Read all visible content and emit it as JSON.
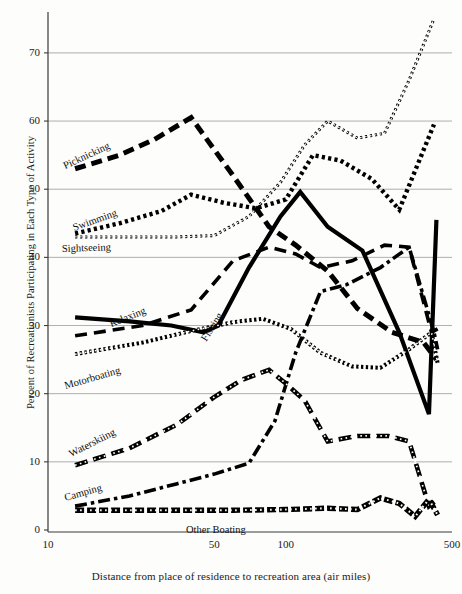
{
  "chart_data": {
    "type": "line",
    "title": "",
    "xlabel": "Distance from place of residence to recreation area (air miles)",
    "ylabel": "Percent of Recreationists Participating in Each Type of Activity",
    "xscale": "log",
    "xlim": [
      10,
      500
    ],
    "ylim": [
      0,
      76
    ],
    "xticks": [
      10,
      50,
      100,
      500
    ],
    "xticklabels": [
      "10",
      "50",
      "100",
      "500"
    ],
    "yticks": [
      0,
      10,
      20,
      30,
      40,
      50,
      60,
      70
    ],
    "yticklabels": [
      "0",
      "10",
      "20",
      "30",
      "40",
      "50",
      "60",
      "70"
    ],
    "grid": "horizontal",
    "legend": "inline-labels",
    "series": [
      {
        "name": "Sightseeing",
        "style": "cross-hatch-thin",
        "label_x": 62,
        "label_y": 243,
        "label_rot": -2,
        "x": [
          13,
          18,
          25,
          35,
          50,
          70,
          95,
          120,
          150,
          200,
          260,
          330,
          420
        ],
        "y": [
          43.0,
          43.0,
          43.0,
          43.0,
          43.2,
          46.0,
          51.0,
          56.5,
          60.0,
          57.5,
          58.2,
          66.0,
          75.0
        ]
      },
      {
        "name": "Swimming",
        "style": "dotted-square",
        "label_x": 75,
        "label_y": 222,
        "label_rot": -20,
        "x": [
          13,
          20,
          30,
          40,
          55,
          75,
          100,
          130,
          170,
          230,
          300,
          420
        ],
        "y": [
          43.5,
          45.0,
          46.8,
          49.2,
          48.0,
          47.2,
          48.5,
          55.0,
          54.2,
          51.5,
          47.0,
          59.5
        ]
      },
      {
        "name": "Picknicking",
        "style": "dashed-heavy",
        "label_x": 66,
        "label_y": 160,
        "label_rot": -25,
        "x": [
          13,
          20,
          28,
          40,
          60,
          85,
          110,
          150,
          200,
          280,
          380,
          430
        ],
        "y": [
          53.0,
          55.0,
          57.3,
          60.5,
          52.0,
          44.5,
          41.8,
          38.0,
          32.5,
          29.0,
          27.5,
          25.0
        ]
      },
      {
        "name": "Fishing",
        "style": "solid-heavy",
        "label_x": 208,
        "label_y": 332,
        "label_rot": -58,
        "x": [
          13,
          22,
          33,
          45,
          52,
          70,
          95,
          115,
          150,
          210,
          300,
          400,
          430
        ],
        "y": [
          31.2,
          30.6,
          30.0,
          29.0,
          30.0,
          38.5,
          46.0,
          49.6,
          44.5,
          41.0,
          29.0,
          17.0,
          45.5
        ]
      },
      {
        "name": "Relaxing",
        "style": "dashed-medium",
        "label_x": 112,
        "label_y": 318,
        "label_rot": -22,
        "x": [
          13,
          25,
          40,
          60,
          85,
          110,
          140,
          190,
          260,
          330,
          410,
          435
        ],
        "y": [
          28.5,
          30.0,
          32.3,
          39.5,
          41.5,
          40.5,
          38.5,
          39.5,
          41.8,
          41.5,
          29.0,
          29.5
        ]
      },
      {
        "name": "Motorboating",
        "style": "cross-hatch-medium",
        "label_x": 66,
        "label_y": 380,
        "label_rot": -16,
        "x": [
          13,
          25,
          40,
          60,
          80,
          105,
          140,
          190,
          250,
          330,
          410,
          435
        ],
        "y": [
          25.8,
          27.5,
          29.2,
          30.5,
          31.0,
          29.5,
          26.0,
          24.0,
          23.8,
          26.5,
          29.0,
          24.5
        ]
      },
      {
        "name": "Camping",
        "style": "dash-dot",
        "label_x": 66,
        "label_y": 492,
        "label_rot": -16,
        "x": [
          13,
          22,
          35,
          50,
          70,
          90,
          110,
          140,
          180,
          250,
          330,
          420,
          435
        ],
        "y": [
          3.5,
          5.0,
          6.8,
          8.2,
          9.8,
          16.0,
          26.0,
          35.0,
          36.0,
          38.5,
          41.5,
          29.0,
          26.5
        ]
      },
      {
        "name": "Waterskiing",
        "style": "dashed-hatched",
        "label_x": 72,
        "label_y": 448,
        "label_rot": -27,
        "x": [
          13,
          22,
          35,
          50,
          65,
          85,
          100,
          120,
          150,
          200,
          270,
          330,
          400,
          435
        ],
        "y": [
          9.5,
          12.0,
          15.5,
          19.5,
          22.0,
          23.5,
          21.5,
          19.0,
          13.0,
          13.8,
          13.8,
          13.0,
          3.5,
          4.5
        ]
      },
      {
        "name": "Other Boating",
        "style": "hatched-flat",
        "label_x": 186,
        "label_y": 524,
        "label_rot": 0,
        "x": [
          13,
          30,
          60,
          100,
          150,
          200,
          250,
          300,
          350,
          400,
          435
        ],
        "y": [
          2.9,
          2.9,
          2.9,
          3.0,
          3.2,
          3.0,
          4.7,
          3.9,
          2.0,
          4.5,
          2.2
        ]
      }
    ]
  }
}
